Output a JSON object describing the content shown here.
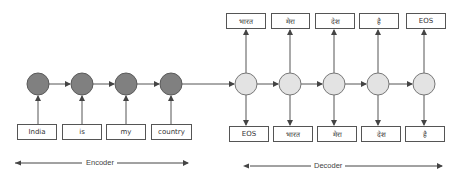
{
  "encoder": {
    "label": "Encoder",
    "inputs": [
      "India",
      "is",
      "my",
      "country"
    ],
    "node_color": "#808080"
  },
  "decoder": {
    "label": "Decoder",
    "inputs": [
      "EOS",
      "भारत",
      "मेरा",
      "देश",
      "है"
    ],
    "outputs": [
      "भारत",
      "मेरा",
      "देश",
      "है",
      "EOS"
    ],
    "node_color": "#e3e3e3"
  },
  "colors": {
    "line": "#555555",
    "box_border": "#555555",
    "text": "#333333"
  }
}
